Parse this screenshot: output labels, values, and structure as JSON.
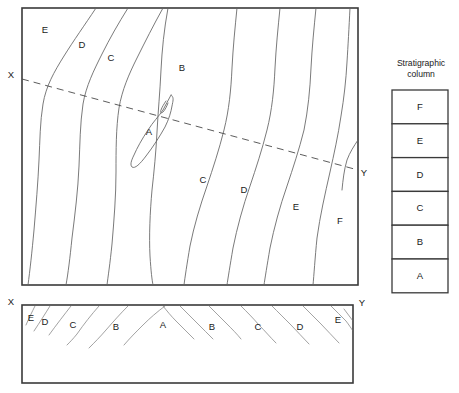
{
  "figure": {
    "type": "geologic-map-and-cross-section"
  },
  "map": {
    "name": "geologic-map",
    "frame": {
      "x": 22,
      "y": 8,
      "width": 336,
      "height": 277
    },
    "unit_labels": [
      {
        "text": "E",
        "x": 45,
        "y": 30
      },
      {
        "text": "D",
        "x": 82,
        "y": 45
      },
      {
        "text": "C",
        "x": 111,
        "y": 58
      },
      {
        "text": "B",
        "x": 182,
        "y": 68
      },
      {
        "text": "A",
        "x": 149,
        "y": 132
      },
      {
        "text": "C",
        "x": 203,
        "y": 180
      },
      {
        "text": "D",
        "x": 244,
        "y": 190
      },
      {
        "text": "E",
        "x": 296,
        "y": 207
      },
      {
        "text": "F",
        "x": 340,
        "y": 221
      }
    ],
    "section_line": {
      "label_start": "X",
      "label_end": "Y",
      "start_label_pos": {
        "x": 11,
        "y": 75
      },
      "end_label_pos": {
        "x": 364,
        "y": 173
      },
      "start": {
        "x": 22,
        "y": 79
      },
      "end": {
        "x": 358,
        "y": 170
      }
    }
  },
  "cross_section": {
    "name": "cross-section-panel",
    "frame": {
      "x": 22,
      "y": 305,
      "width": 331,
      "height": 78
    },
    "label_start": "X",
    "label_end": "Y",
    "start_label_pos": {
      "x": 11,
      "y": 302
    },
    "end_label_pos": {
      "x": 362,
      "y": 303
    },
    "unit_labels": [
      {
        "text": "E",
        "x": 31,
        "y": 318
      },
      {
        "text": "D",
        "x": 45,
        "y": 322
      },
      {
        "text": "C",
        "x": 73,
        "y": 325
      },
      {
        "text": "B",
        "x": 116,
        "y": 327
      },
      {
        "text": "A",
        "x": 163,
        "y": 325
      },
      {
        "text": "B",
        "x": 212,
        "y": 327
      },
      {
        "text": "C",
        "x": 258,
        "y": 327
      },
      {
        "text": "D",
        "x": 300,
        "y": 327
      },
      {
        "text": "E",
        "x": 338,
        "y": 320
      }
    ]
  },
  "stratigraphic_column": {
    "name": "stratigraphic-column",
    "title_line1": "Stratigraphic",
    "title_line2": "column",
    "title_pos": {
      "x": 421,
      "y": 66
    },
    "box": {
      "x": 392,
      "y": 90,
      "width": 56,
      "height": 203
    },
    "cell_height": 33.8,
    "units_top_to_bottom": [
      "F",
      "E",
      "D",
      "C",
      "B",
      "A"
    ],
    "note_order": "F is youngest at top, A is oldest at bottom"
  },
  "colors": {
    "frame_stroke": "#3a3a3a",
    "contact_stroke": "#6b6b6b",
    "dip_stroke": "#8a8a8a",
    "section_stroke": "#4a4a4a",
    "background": "#ffffff",
    "text": "#1a1a1a"
  }
}
